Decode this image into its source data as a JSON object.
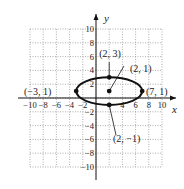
{
  "chart_data": {
    "type": "scatter",
    "title": "",
    "xlabel": "x",
    "ylabel": "y",
    "xlim": [
      -10,
      10
    ],
    "ylim": [
      -10,
      10
    ],
    "grid": true,
    "x_ticks": [
      "-10",
      "-8",
      "-6",
      "-4",
      "-2",
      "4",
      "6",
      "8",
      "10"
    ],
    "y_ticks": [
      "10",
      "8",
      "6",
      "4",
      "2",
      "-2",
      "-4",
      "-6",
      "-8",
      "-10"
    ],
    "curve": {
      "shape": "ellipse",
      "center": [
        2,
        1
      ],
      "semi_major_x": 5,
      "semi_minor_y": 2
    },
    "points": [
      {
        "x": 2,
        "y": 1,
        "label": "(2, 1)"
      },
      {
        "x": 2,
        "y": 3,
        "label": "(2, 3)"
      },
      {
        "x": 2,
        "y": -1,
        "label": "(2, −1)"
      },
      {
        "x": -3,
        "y": 1,
        "label": "(−3, 1)"
      },
      {
        "x": 7,
        "y": 1,
        "label": "(7, 1)"
      }
    ]
  }
}
